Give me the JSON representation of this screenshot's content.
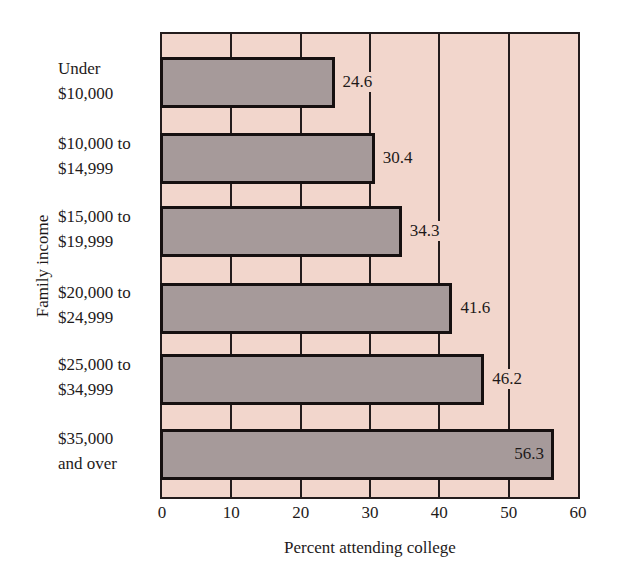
{
  "chart_data": {
    "type": "bar",
    "orientation": "horizontal",
    "title": "",
    "xlabel": "Percent attending college",
    "ylabel": "Family income",
    "categories": [
      "Under $10,000",
      "$10,000 to $14,999",
      "$15,000 to $19,999",
      "$20,000 to $24,999",
      "$25,000 to $34,999",
      "$35,000 and over"
    ],
    "category_lines": [
      [
        "Under",
        "$10,000"
      ],
      [
        "$10,000 to",
        "$14,999"
      ],
      [
        "$15,000 to",
        "$19,999"
      ],
      [
        "$20,000 to",
        "$24,999"
      ],
      [
        "$25,000 to",
        "$34,999"
      ],
      [
        "$35,000",
        "and over"
      ]
    ],
    "values": [
      24.6,
      30.4,
      34.3,
      41.6,
      46.2,
      56.3
    ],
    "value_labels": [
      "24.6",
      "30.4",
      "34.3",
      "41.6",
      "46.2",
      "56.3"
    ],
    "xlim": [
      0,
      60
    ],
    "xticks": [
      "0",
      "10",
      "20",
      "30",
      "40",
      "50",
      "60"
    ],
    "grid": "vertical lines at every 10",
    "legend": "none",
    "colors": {
      "background": "#f2d6cc",
      "bar": "#a69a9a",
      "outline": "#161010"
    }
  }
}
